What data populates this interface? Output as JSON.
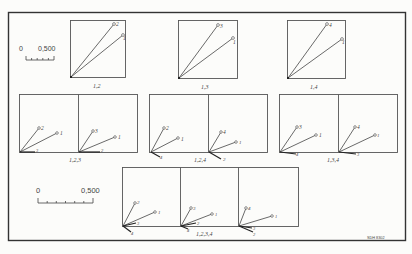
{
  "figure": {
    "id_tag": "SDH 8302",
    "scale_bars": [
      {
        "start_label": "0",
        "end_label": "0,500",
        "ticks": 5
      },
      {
        "start_label": "0",
        "end_label": "0,500",
        "ticks": 6
      }
    ],
    "row1": [
      {
        "label": "1,2",
        "vectors": [
          "2",
          "1"
        ]
      },
      {
        "label": "1,3",
        "vectors": [
          "3",
          "1"
        ]
      },
      {
        "label": "1,4",
        "vectors": [
          "4",
          "1"
        ]
      }
    ],
    "row2": [
      {
        "label": "1,2,3",
        "panes": [
          {
            "vectors": [
              "2",
              "1",
              "3"
            ]
          },
          {
            "vectors": [
              "3",
              "1",
              "2"
            ]
          }
        ]
      },
      {
        "label": "1,2,4",
        "panes": [
          {
            "vectors": [
              "2",
              "1",
              "4"
            ]
          },
          {
            "vectors": [
              "4",
              "1",
              "2"
            ]
          }
        ]
      },
      {
        "label": "1,3,4",
        "panes": [
          {
            "vectors": [
              "3",
              "1",
              "4"
            ]
          },
          {
            "vectors": [
              "4",
              "1",
              "3"
            ]
          }
        ]
      }
    ],
    "row3": [
      {
        "label": "1,2,3,4",
        "panes": [
          {
            "vectors": [
              "2",
              "1",
              "3",
              "4"
            ]
          },
          {
            "vectors": [
              "3",
              "1",
              "2",
              "4"
            ]
          },
          {
            "vectors": [
              "4",
              "1",
              "3",
              "2"
            ]
          }
        ]
      }
    ]
  }
}
